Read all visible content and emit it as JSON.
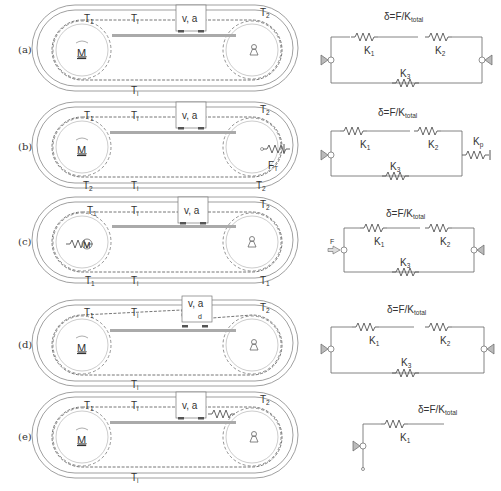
{
  "panels": [
    {
      "id": "a",
      "label": "(a)",
      "carriage": "v, a",
      "tensions": {
        "top_left": "T",
        "top_left_sub": "1",
        "top_mid": "T",
        "top_mid_sub": "i",
        "top_right": "T",
        "top_right_sub": "2",
        "bottom_mid": "T",
        "bottom_mid_sub": "i"
      },
      "motor": "M",
      "network": {
        "formula": "δ=F/K",
        "formula_sub": "total",
        "k1": "K",
        "k1_sub": "1",
        "k2": "K",
        "k2_sub": "2",
        "k3": "K",
        "k3_sub": "3"
      }
    },
    {
      "id": "b",
      "label": "(b)",
      "carriage": "v, a",
      "tensions": {
        "top_left": "T",
        "top_left_sub": "1",
        "top_mid": "T",
        "top_mid_sub": "i",
        "top_right": "T",
        "top_right_sub": "2",
        "bottom_left": "T",
        "bottom_left_sub": "2",
        "bottom_mid": "T",
        "bottom_mid_sub": "i",
        "bottom_right": "T",
        "bottom_right_sub": "2"
      },
      "motor": "M",
      "tensioner": "F",
      "tensioner_sub": "T",
      "network": {
        "formula": "δ=F/K",
        "formula_sub": "total",
        "k1": "K",
        "k1_sub": "1",
        "k2": "K",
        "k2_sub": "2",
        "k3": "K",
        "k3_sub": "3",
        "kp": "K",
        "kp_sub": "p"
      }
    },
    {
      "id": "c",
      "label": "(c)",
      "carriage": "v, a",
      "tensions": {
        "top_left": "T",
        "top_left_sub": "1",
        "top_mid": "T",
        "top_mid_sub": "i",
        "top_right": "T",
        "top_right_sub": "2",
        "bottom_left": "T",
        "bottom_left_sub": "1",
        "bottom_mid": "T",
        "bottom_mid_sub": "i",
        "bottom_right": "T",
        "bottom_right_sub": "1"
      },
      "motor": "M",
      "network": {
        "formula": "δ=F/K",
        "formula_sub": "total",
        "force": "F",
        "k1": "K",
        "k1_sub": "1",
        "k2": "K",
        "k2_sub": "2",
        "k3": "K",
        "k3_sub": "3"
      }
    },
    {
      "id": "d",
      "label": "(d)",
      "carriage": "v, a",
      "tensions": {
        "top_left": "T",
        "top_left_sub": "1",
        "top_mid": "T",
        "top_mid_sub": "i",
        "top_right": "T",
        "top_right_sub": "2",
        "bottom_mid": "T",
        "bottom_mid_sub": "i"
      },
      "motor": "M",
      "offset": "d",
      "network": {
        "formula": "δ=F/K",
        "formula_sub": "total",
        "k1": "K",
        "k1_sub": "1",
        "k2": "K",
        "k2_sub": "2",
        "k3": "K",
        "k3_sub": "3"
      }
    },
    {
      "id": "e",
      "label": "(e)",
      "carriage": "v, a",
      "tensions": {
        "top_left": "T",
        "top_left_sub": "1",
        "top_mid": "T",
        "top_mid_sub": "i",
        "top_right": "T",
        "top_right_sub": "2",
        "bottom_mid": "T",
        "bottom_mid_sub": "i"
      },
      "motor": "M",
      "network": {
        "formula": "δ=F/K",
        "formula_sub": "total",
        "k1": "K",
        "k1_sub": "1"
      }
    }
  ]
}
